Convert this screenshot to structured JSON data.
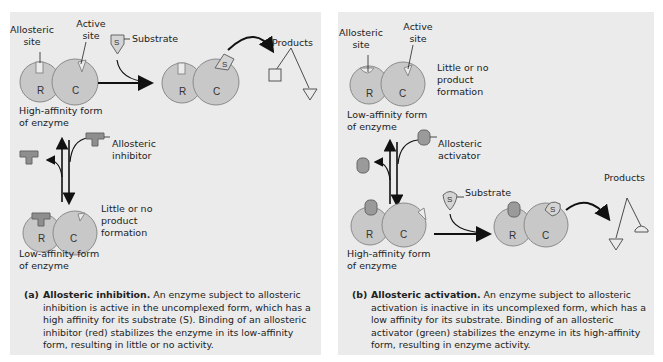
{
  "colors": {
    "panel_bg": "#ebebeb",
    "enzyme_fill": "#c8c8c8",
    "enzyme_stroke": "#8a8a8a",
    "inhibitor_fill": "#8e8e8e",
    "activator_fill": "#9a9a9a",
    "substrate_fill": "#d4d4d4",
    "arrow": "#111111"
  },
  "panel_a": {
    "labels": {
      "allosteric_site": "Allosteric\nsite",
      "active_site": "Active\nsite",
      "substrate": "Substrate",
      "products": "Products",
      "high_affinity": "High-affinity form\nof enzyme",
      "allosteric_inhibitor": "Allosteric\ninhibitor",
      "little_or_no": "Little or no\nproduct\nformation",
      "low_affinity": "Low-affinity form\nof enzyme",
      "subunit_r": "R",
      "subunit_c": "C",
      "substrate_letter": "S"
    },
    "caption": {
      "tag": "(a)",
      "title": "Allosteric inhibition.",
      "text": " An enzyme subject to allosteric inhibition is active in the uncomplexed form, which has a high affinity for its substrate (S). Binding of an allosteric inhibitor (red) stabilizes the enzyme in its low-affinity form, resulting in little or no activity."
    }
  },
  "panel_b": {
    "labels": {
      "allosteric_site": "Allosteric\nsite",
      "active_site": "Active\nsite",
      "little_or_no": "Little or no\nproduct\nformation",
      "low_affinity": "Low-affinity form\nof enzyme",
      "allosteric_activator": "Allosteric\nactivator",
      "substrate": "Substrate",
      "products": "Products",
      "high_affinity": "High-affinity form\nof enzyme",
      "subunit_r": "R",
      "subunit_c": "C",
      "substrate_letter": "S"
    },
    "caption": {
      "tag": "(b)",
      "title": "Allosteric activation.",
      "text": " An enzyme subject to allosteric activation is inactive in its uncomplexed form, which has a low affinity for its substrate.  Binding of an allosteric activator (green) stabilizes the enzyme in its high-affinity form, resulting in enzyme activity."
    }
  }
}
